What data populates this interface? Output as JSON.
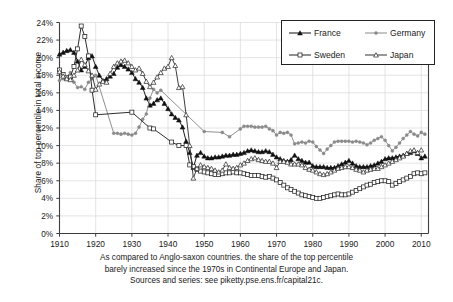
{
  "chart_data": {
    "type": "line",
    "title": "",
    "xlabel": "",
    "ylabel": "Share of top percentile in total income",
    "xlim": [
      1910,
      2012
    ],
    "ylim": [
      0,
      24
    ],
    "yunit": "%",
    "grid": true,
    "legend_position": "top-right",
    "xticks": [
      1910,
      1920,
      1930,
      1940,
      1950,
      1960,
      1970,
      1980,
      1990,
      2000,
      2010
    ],
    "xticklabels": [
      "1910",
      "1920",
      "1930",
      "1940",
      "1950",
      "1960",
      "1970",
      "1980",
      "1990",
      "2000",
      "2010"
    ],
    "yticks": [
      0,
      2,
      4,
      6,
      8,
      10,
      12,
      14,
      16,
      18,
      20,
      22,
      24
    ],
    "yticklabels": [
      "0%",
      "2%",
      "4%",
      "6%",
      "8%",
      "10%",
      "12%",
      "14%",
      "16%",
      "18%",
      "20%",
      "22%",
      "24%"
    ],
    "series": [
      {
        "name": "France",
        "color": "#111111",
        "marker": "triangle-filled",
        "x": [
          1910,
          1911,
          1912,
          1913,
          1914,
          1915,
          1916,
          1917,
          1918,
          1919,
          1920,
          1921,
          1922,
          1923,
          1924,
          1925,
          1926,
          1927,
          1928,
          1929,
          1930,
          1931,
          1932,
          1933,
          1934,
          1935,
          1936,
          1937,
          1938,
          1939,
          1940,
          1941,
          1942,
          1943,
          1944,
          1945,
          1946,
          1947,
          1948,
          1949,
          1950,
          1951,
          1952,
          1953,
          1954,
          1955,
          1956,
          1957,
          1958,
          1959,
          1960,
          1961,
          1962,
          1963,
          1964,
          1965,
          1966,
          1967,
          1968,
          1969,
          1970,
          1971,
          1972,
          1973,
          1974,
          1975,
          1976,
          1977,
          1978,
          1979,
          1980,
          1981,
          1982,
          1983,
          1984,
          1985,
          1986,
          1987,
          1988,
          1989,
          1990,
          1991,
          1992,
          1993,
          1994,
          1995,
          1996,
          1997,
          1998,
          1999,
          2000,
          2001,
          2002,
          2003,
          2004,
          2005,
          2006,
          2007,
          2008,
          2009,
          2010,
          2011
        ],
        "y": [
          20.4,
          20.6,
          20.8,
          20.9,
          20.6,
          19.6,
          18.6,
          19.0,
          20.0,
          20.2,
          19.0,
          18.0,
          17.4,
          17.6,
          17.9,
          18.2,
          18.9,
          19.2,
          19.0,
          18.7,
          18.3,
          17.6,
          17.2,
          16.6,
          15.4,
          14.6,
          14.8,
          15.2,
          15.4,
          14.8,
          14.2,
          13.6,
          13.2,
          12.9,
          12.1,
          10.5,
          9.2,
          7.5,
          8.9,
          9.2,
          8.8,
          8.6,
          8.6,
          8.7,
          8.7,
          8.8,
          8.9,
          8.9,
          9.0,
          9.0,
          9.1,
          9.2,
          9.4,
          9.5,
          9.4,
          9.3,
          9.3,
          9.4,
          9.3,
          9.0,
          8.7,
          8.5,
          8.3,
          8.2,
          8.4,
          8.9,
          8.5,
          8.3,
          8.1,
          8.1,
          7.7,
          7.6,
          7.6,
          7.6,
          7.5,
          7.5,
          7.5,
          7.7,
          7.9,
          8.1,
          8.3,
          8.0,
          7.7,
          7.6,
          7.6,
          7.6,
          7.7,
          7.8,
          8.0,
          8.2,
          8.5,
          8.6,
          8.6,
          8.7,
          8.8,
          8.9,
          9.1,
          9.2,
          9.4,
          9.1,
          8.6,
          8.8
        ]
      },
      {
        "name": "Germany",
        "color": "#8a8a8a",
        "marker": "dot-filled",
        "x": [
          1910,
          1911,
          1912,
          1913,
          1914,
          1915,
          1916,
          1917,
          1918,
          1919,
          1920,
          1925,
          1926,
          1927,
          1928,
          1929,
          1930,
          1931,
          1932,
          1933,
          1934,
          1935,
          1936,
          1937,
          1938,
          1950,
          1955,
          1957,
          1960,
          1961,
          1962,
          1963,
          1964,
          1965,
          1966,
          1967,
          1968,
          1969,
          1970,
          1971,
          1972,
          1973,
          1974,
          1975,
          1976,
          1977,
          1978,
          1979,
          1980,
          1981,
          1982,
          1983,
          1984,
          1985,
          1986,
          1987,
          1988,
          1989,
          1990,
          1991,
          1992,
          1993,
          1994,
          1995,
          1996,
          1997,
          1998,
          1999,
          2000,
          2001,
          2002,
          2003,
          2004,
          2005,
          2006,
          2007,
          2008,
          2009,
          2010,
          2011
        ],
        "y": [
          17.4,
          17.6,
          17.8,
          18.3,
          17.2,
          16.6,
          16.7,
          16.4,
          17.2,
          17.6,
          18.0,
          11.4,
          11.4,
          11.3,
          11.4,
          11.3,
          11.2,
          11.4,
          12.1,
          13.0,
          13.6,
          15.4,
          16.4,
          16.0,
          16.3,
          11.6,
          11.5,
          11.0,
          11.9,
          12.2,
          12.2,
          12.2,
          12.1,
          12.1,
          12.1,
          12.2,
          11.9,
          11.7,
          11.2,
          11.5,
          11.4,
          11.5,
          11.2,
          10.2,
          10.3,
          10.4,
          10.3,
          10.5,
          10.4,
          9.9,
          9.5,
          9.1,
          9.6,
          10.0,
          10.4,
          10.5,
          10.5,
          10.5,
          10.5,
          10.4,
          10.5,
          10.4,
          10.3,
          10.1,
          10.3,
          10.6,
          10.8,
          11.0,
          10.6,
          10.0,
          9.4,
          9.8,
          10.3,
          10.8,
          11.2,
          11.6,
          11.3,
          11.1,
          11.5,
          11.3
        ]
      },
      {
        "name": "Sweden",
        "color": "#222222",
        "marker": "square-open",
        "x": [
          1910,
          1911,
          1912,
          1913,
          1914,
          1915,
          1916,
          1917,
          1918,
          1919,
          1920,
          1930,
          1935,
          1936,
          1941,
          1943,
          1945,
          1946,
          1947,
          1948,
          1949,
          1950,
          1951,
          1952,
          1953,
          1954,
          1955,
          1956,
          1957,
          1958,
          1959,
          1960,
          1961,
          1962,
          1963,
          1964,
          1965,
          1966,
          1967,
          1968,
          1969,
          1970,
          1971,
          1972,
          1973,
          1974,
          1975,
          1976,
          1977,
          1978,
          1979,
          1980,
          1981,
          1982,
          1983,
          1984,
          1985,
          1986,
          1987,
          1988,
          1989,
          1990,
          1991,
          1992,
          1993,
          1994,
          1995,
          1996,
          1997,
          1998,
          1999,
          2000,
          2001,
          2002,
          2003,
          2004,
          2005,
          2006,
          2007,
          2008,
          2009,
          2010,
          2011
        ],
        "y": [
          18.6,
          18.1,
          17.7,
          17.8,
          19.0,
          21.0,
          23.6,
          22.4,
          20.2,
          16.3,
          13.5,
          13.8,
          12.0,
          11.9,
          10.4,
          10.0,
          10.0,
          7.8,
          7.6,
          7.3,
          7.1,
          7.0,
          6.9,
          6.8,
          6.7,
          6.7,
          6.8,
          6.9,
          6.9,
          7.0,
          6.9,
          6.9,
          6.8,
          6.7,
          6.6,
          6.6,
          6.6,
          6.5,
          6.4,
          6.5,
          6.3,
          6.1,
          5.8,
          5.5,
          5.2,
          5.0,
          4.8,
          4.6,
          4.4,
          4.3,
          4.2,
          4.1,
          4.0,
          4.0,
          4.1,
          4.2,
          4.3,
          4.4,
          4.5,
          4.4,
          4.4,
          4.5,
          4.7,
          4.9,
          5.1,
          5.3,
          5.5,
          5.6,
          5.8,
          5.9,
          6.0,
          6.0,
          5.9,
          5.5,
          5.7,
          5.9,
          6.1,
          6.3,
          6.5,
          6.8,
          6.9,
          6.8,
          6.9
        ]
      },
      {
        "name": "Japan",
        "color": "#333333",
        "marker": "triangle-open",
        "x": [
          1910,
          1911,
          1912,
          1913,
          1914,
          1915,
          1916,
          1917,
          1918,
          1919,
          1920,
          1921,
          1922,
          1923,
          1924,
          1925,
          1926,
          1927,
          1928,
          1929,
          1930,
          1931,
          1932,
          1933,
          1934,
          1935,
          1936,
          1937,
          1938,
          1939,
          1940,
          1941,
          1942,
          1943,
          1944,
          1945,
          1946,
          1947,
          1948,
          1949,
          1950,
          1951,
          1952,
          1953,
          1954,
          1955,
          1956,
          1957,
          1958,
          1959,
          1960,
          1961,
          1962,
          1963,
          1964,
          1965,
          1966,
          1967,
          1968,
          1969,
          1970,
          1971,
          1972,
          1973,
          1974,
          1975,
          1976,
          1977,
          1978,
          1979,
          1980,
          1981,
          1982,
          1983,
          1984,
          1985,
          1986,
          1987,
          1988,
          1989,
          1990,
          1991,
          1992,
          1993,
          1994,
          1995,
          1996,
          1997,
          1998,
          1999,
          2000,
          2001,
          2002,
          2003,
          2004,
          2005,
          2006,
          2007,
          2008,
          2009,
          2010
        ],
        "y": [
          18.4,
          17.9,
          17.6,
          17.5,
          18.0,
          18.6,
          19.8,
          19.2,
          18.5,
          18.0,
          16.4,
          17.0,
          17.3,
          17.2,
          18.2,
          19.0,
          19.4,
          19.6,
          19.7,
          19.4,
          19.0,
          18.6,
          18.8,
          18.2,
          17.3,
          16.7,
          17.2,
          17.8,
          18.3,
          18.8,
          19.0,
          20.0,
          19.1,
          16.6,
          16.7,
          13.5,
          10.0,
          6.3,
          7.4,
          7.8,
          7.6,
          7.5,
          7.4,
          7.2,
          7.0,
          7.2,
          7.9,
          7.5,
          7.4,
          7.5,
          7.8,
          8.0,
          8.3,
          8.5,
          8.6,
          8.4,
          8.3,
          8.2,
          8.2,
          8.0,
          7.5,
          8.2,
          8.2,
          8.1,
          7.9,
          7.9,
          7.9,
          7.8,
          7.5,
          7.3,
          7.2,
          7.0,
          6.8,
          6.7,
          6.8,
          7.0,
          7.2,
          7.4,
          7.5,
          7.6,
          7.6,
          7.5,
          7.3,
          7.2,
          7.0,
          7.2,
          7.3,
          7.4,
          7.4,
          7.6,
          7.8,
          8.0,
          8.2,
          8.4,
          8.6,
          8.8,
          9.1,
          9.4,
          9.5,
          9.2,
          9.5
        ]
      }
    ]
  },
  "legend": {
    "entries": [
      {
        "label": "France",
        "marker": "triangle-filled"
      },
      {
        "label": "Germany",
        "marker": "dot-filled"
      },
      {
        "label": "Sweden",
        "marker": "square-open"
      },
      {
        "label": "Japan",
        "marker": "triangle-open"
      }
    ]
  },
  "caption": {
    "line1": "As compared to Anglo-saxon countries. the share of the top percentile",
    "line2": "barely increased since the 1970s in Continental Europe and Japan.",
    "line3": "Sources and series: see piketty.pse.ens.fr/capital21c."
  },
  "colors": {
    "axis": "#3d3d3d",
    "grid": "#d8d8d8",
    "france": "#111111",
    "germany": "#8a8a8a",
    "sweden": "#222222",
    "japan": "#333333",
    "background": "#ffffff"
  }
}
